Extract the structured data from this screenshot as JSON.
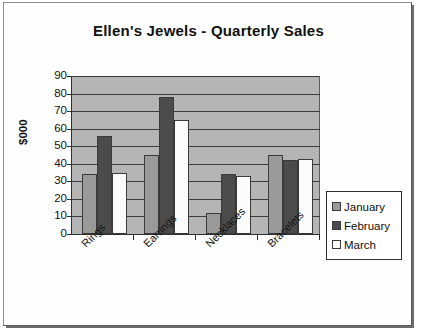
{
  "chart_data": {
    "type": "bar",
    "title": "Ellen's Jewels - Quarterly Sales",
    "xlabel": "",
    "ylabel": "$000",
    "categories": [
      "Rings",
      "Earrings",
      "Necklaces",
      "Bracelets"
    ],
    "series": [
      {
        "name": "January",
        "values": [
          34,
          45,
          12,
          45
        ],
        "color": "#9a9a9a"
      },
      {
        "name": "February",
        "values": [
          56,
          78,
          34,
          42
        ],
        "color": "#4b4b4b"
      },
      {
        "name": "March",
        "values": [
          35,
          65,
          33,
          43
        ],
        "color": "#ffffff"
      }
    ],
    "ylim": [
      0,
      90
    ],
    "ytick_step": 10,
    "ytick_labels": [
      "90",
      "80",
      "70",
      "60",
      "50",
      "40",
      "30",
      "20",
      "10",
      "0"
    ],
    "grid": true,
    "grid_axis": "y",
    "legend_position": "right",
    "plot_background": "#b5b5b5",
    "gridline_color": "#3c3c3c",
    "axis_color": "#303030"
  }
}
